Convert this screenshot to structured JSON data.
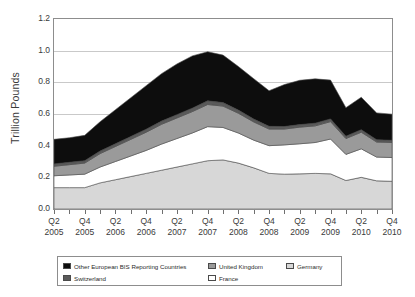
{
  "chart_data": {
    "type": "area",
    "stacked": true,
    "title": "",
    "subtitle": "",
    "xlabel": "",
    "ylabel": "Trillion Pounds",
    "ylim": [
      0.0,
      1.2
    ],
    "ytick_labels": [
      "1.2",
      "1.0",
      "0.8",
      "0.6",
      "0.4",
      "0.2",
      "0.0"
    ],
    "ytick_values": [
      1.2,
      1.0,
      0.8,
      0.6,
      0.4,
      0.2,
      0.0
    ],
    "grid": true,
    "legend_position": "bottom",
    "x": [
      "Q2 2005",
      "Q3 2005",
      "Q4 2005",
      "Q1 2006",
      "Q2 2006",
      "Q3 2006",
      "Q4 2006",
      "Q1 2007",
      "Q2 2007",
      "Q3 2007",
      "Q4 2007",
      "Q1 2008",
      "Q2 2008",
      "Q3 2008",
      "Q4 2008",
      "Q1 2009",
      "Q2 2009",
      "Q3 2009",
      "Q4 2009",
      "Q1 2010",
      "Q2 2010",
      "Q3 2010",
      "Q4 2010"
    ],
    "xtick_labels": [
      {
        "quarter": "Q2",
        "year": "2005",
        "index": 0
      },
      {
        "quarter": "Q4",
        "year": "2005",
        "index": 2
      },
      {
        "quarter": "Q2",
        "year": "2006",
        "index": 4
      },
      {
        "quarter": "Q4",
        "year": "2006",
        "index": 6
      },
      {
        "quarter": "Q2",
        "year": "2007",
        "index": 8
      },
      {
        "quarter": "Q4",
        "year": "2007",
        "index": 10
      },
      {
        "quarter": "Q2",
        "year": "2008",
        "index": 12
      },
      {
        "quarter": "Q4",
        "year": "2008",
        "index": 14
      },
      {
        "quarter": "Q2",
        "year": "2009",
        "index": 16
      },
      {
        "quarter": "Q4",
        "year": "2009",
        "index": 18
      },
      {
        "quarter": "Q2",
        "year": "2010",
        "index": 20
      },
      {
        "quarter": "Q4",
        "year": "2010",
        "index": 22
      }
    ],
    "series": [
      {
        "name": "Germany",
        "color": "#d7d7d7",
        "stack_order": 0,
        "values": [
          0.135,
          0.135,
          0.135,
          0.165,
          0.185,
          0.205,
          0.225,
          0.245,
          0.265,
          0.285,
          0.305,
          0.31,
          0.29,
          0.26,
          0.225,
          0.22,
          0.222,
          0.225,
          0.222,
          0.18,
          0.2,
          0.178,
          0.175
        ]
      },
      {
        "name": "France",
        "color": "#ffffff",
        "stack_order": 1,
        "values": [
          0.075,
          0.08,
          0.085,
          0.1,
          0.115,
          0.13,
          0.145,
          0.165,
          0.18,
          0.195,
          0.215,
          0.205,
          0.19,
          0.175,
          0.175,
          0.185,
          0.19,
          0.195,
          0.22,
          0.165,
          0.18,
          0.15,
          0.15
        ]
      },
      {
        "name": "United Kingdom",
        "color": "#9a9a9a",
        "stack_order": 2,
        "values": [
          0.06,
          0.065,
          0.07,
          0.085,
          0.095,
          0.105,
          0.115,
          0.125,
          0.13,
          0.135,
          0.14,
          0.135,
          0.125,
          0.115,
          0.105,
          0.1,
          0.105,
          0.105,
          0.11,
          0.1,
          0.105,
          0.095,
          0.095
        ]
      },
      {
        "name": "Switzerland",
        "color": "#5a5a5a",
        "stack_order": 3,
        "values": [
          0.015,
          0.015,
          0.015,
          0.016,
          0.017,
          0.018,
          0.019,
          0.02,
          0.021,
          0.022,
          0.023,
          0.022,
          0.02,
          0.018,
          0.017,
          0.016,
          0.016,
          0.017,
          0.017,
          0.015,
          0.016,
          0.014,
          0.014
        ]
      },
      {
        "name": "Other European BIS Reporting Countries",
        "color": "#0d0d0d",
        "stack_order": 4,
        "values": [
          0.155,
          0.155,
          0.16,
          0.185,
          0.215,
          0.245,
          0.275,
          0.3,
          0.32,
          0.33,
          0.31,
          0.3,
          0.275,
          0.255,
          0.225,
          0.265,
          0.28,
          0.28,
          0.245,
          0.18,
          0.205,
          0.17,
          0.165
        ]
      }
    ],
    "stack_totals": [
      0.44,
      0.45,
      0.465,
      0.551,
      0.627,
      0.703,
      0.779,
      0.855,
      0.916,
      0.967,
      0.993,
      0.972,
      0.9,
      0.823,
      0.747,
      0.786,
      0.813,
      0.822,
      0.814,
      0.64,
      0.706,
      0.607,
      0.599
    ]
  },
  "legend": {
    "rows": [
      [
        {
          "label": "Other European BIS Reporting Countries",
          "color": "#0d0d0d"
        },
        {
          "label": "United Kingdom",
          "color": "#9a9a9a"
        },
        {
          "label": "Germany",
          "color": "#d7d7d7"
        }
      ],
      [
        {
          "label": "Switzerland",
          "color": "#5a5a5a"
        },
        {
          "label": "France",
          "color": "#ffffff"
        }
      ]
    ]
  },
  "axes": {
    "y_title": "Trillion Pounds"
  }
}
